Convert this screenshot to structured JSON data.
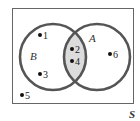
{
  "diagram": {
    "type": "venn",
    "universe_label": "S",
    "sets": [
      {
        "name": "B",
        "label": "B"
      },
      {
        "name": "A",
        "label": "A"
      }
    ],
    "intersection_shaded": true,
    "elements": [
      {
        "value": "1",
        "region": "B only"
      },
      {
        "value": "2",
        "region": "A and B"
      },
      {
        "value": "3",
        "region": "B only"
      },
      {
        "value": "4",
        "region": "A and B"
      },
      {
        "value": "5",
        "region": "outside"
      },
      {
        "value": "6",
        "region": "A only"
      }
    ],
    "colors": {
      "circle_stroke": "#555555",
      "intersection_fill": "#dcdcdc",
      "border": "#666666"
    }
  }
}
